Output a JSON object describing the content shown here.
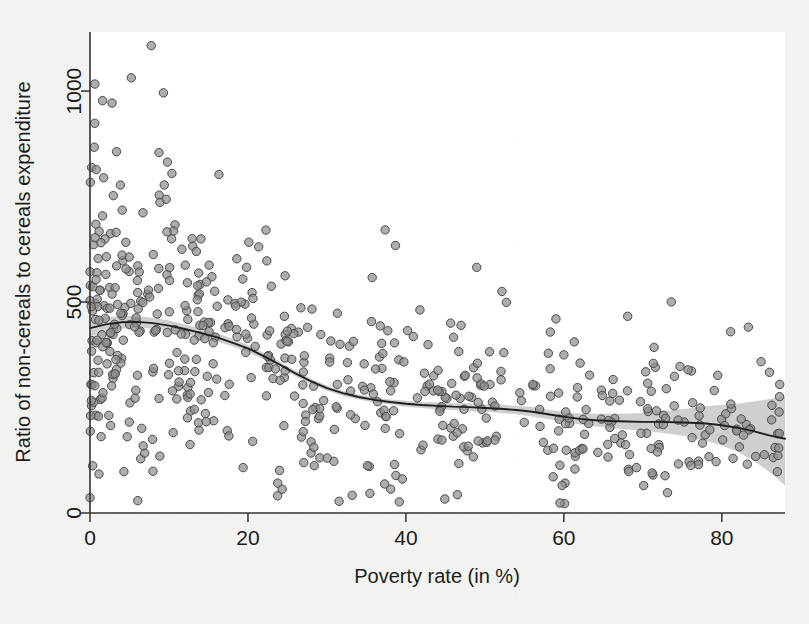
{
  "figure": {
    "background_color": "#f2f2f0",
    "plot_background_color": "#ffffff",
    "width": 809,
    "height": 624
  },
  "chart_data": {
    "type": "scatter",
    "title": "",
    "subtitle": "",
    "xlabel": "Poverty rate (in %)",
    "ylabel": "Ratio of non-cereals to cereals expenditure",
    "xlim": [
      0,
      88
    ],
    "ylim": [
      0,
      1140
    ],
    "xticks": [
      0,
      20,
      40,
      60,
      80
    ],
    "xticklabels": [
      "0",
      "20",
      "40",
      "60",
      "80"
    ],
    "yticks": [
      0,
      500,
      1000
    ],
    "yticklabels": [
      "0",
      "500",
      "1000"
    ],
    "grid": false,
    "legend": null,
    "legend_position": "none",
    "marker": {
      "shape": "circle",
      "radius": 4.2,
      "fill_color": "#8f8f8f",
      "edge_color": "#4a4a4a",
      "fill_opacity": 0.72,
      "edge_width": 1.0
    },
    "fit": {
      "name": "lowess smoothed fit",
      "line_color": "#1f1f1f",
      "line_width": 1.8,
      "band_color": "#bfbfbf",
      "band_opacity": 0.75,
      "x": [
        0,
        2,
        4,
        6,
        8,
        10,
        12,
        14,
        16,
        18,
        20,
        22,
        24,
        26,
        28,
        30,
        32,
        34,
        36,
        38,
        40,
        42,
        44,
        46,
        48,
        50,
        52,
        54,
        56,
        58,
        60,
        62,
        64,
        66,
        68,
        70,
        72,
        74,
        76,
        78,
        80,
        82,
        84,
        86,
        88
      ],
      "y": [
        438,
        447,
        452,
        453,
        450,
        444,
        436,
        427,
        417,
        404,
        390,
        372,
        352,
        331,
        312,
        296,
        284,
        275,
        268,
        263,
        259,
        256,
        254,
        252,
        251,
        249,
        247,
        244,
        240,
        234,
        228,
        223,
        220,
        218,
        217,
        216,
        216,
        215,
        214,
        212,
        208,
        202,
        194,
        184,
        176
      ],
      "lower": [
        418,
        430,
        437,
        439,
        437,
        432,
        425,
        417,
        407,
        395,
        381,
        364,
        345,
        324,
        306,
        290,
        278,
        269,
        262,
        257,
        252,
        249,
        246,
        244,
        242,
        240,
        237,
        234,
        229,
        223,
        216,
        210,
        205,
        201,
        198,
        195,
        191,
        186,
        180,
        171,
        160,
        145,
        124,
        98,
        66
      ],
      "upper": [
        458,
        464,
        467,
        467,
        463,
        456,
        447,
        437,
        427,
        413,
        399,
        380,
        359,
        338,
        318,
        302,
        290,
        281,
        274,
        269,
        266,
        263,
        262,
        260,
        260,
        258,
        257,
        254,
        251,
        245,
        240,
        236,
        235,
        235,
        236,
        237,
        241,
        244,
        248,
        253,
        256,
        259,
        264,
        270,
        276
      ]
    },
    "n_points": 620
  }
}
